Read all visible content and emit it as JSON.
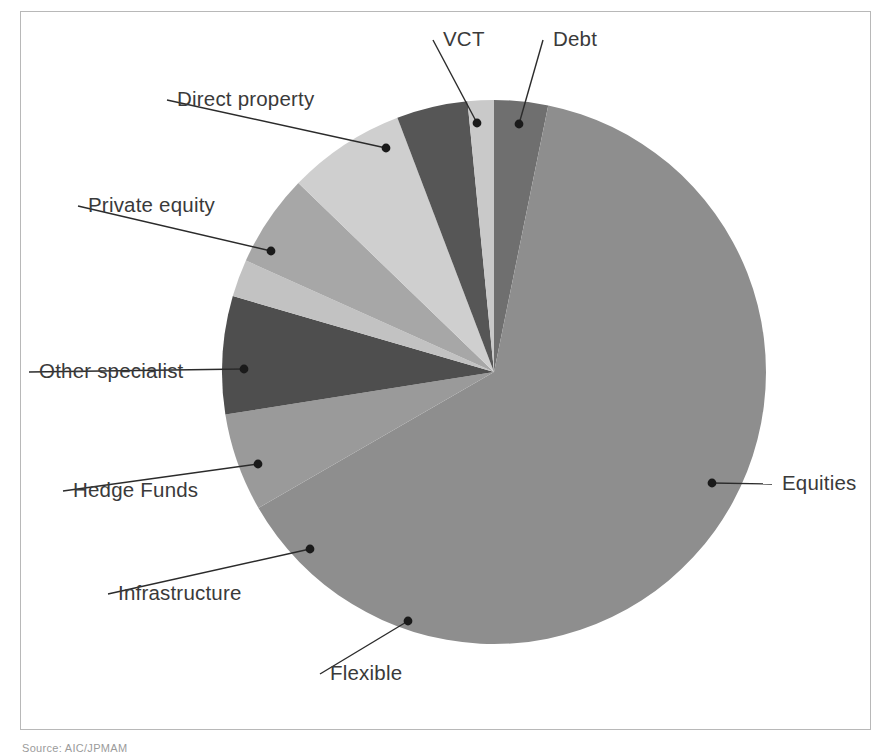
{
  "figure": {
    "caption": "Source: AIC/JPMAM",
    "frame_color": "#b8b8b8",
    "background": "#ffffff"
  },
  "chart_data": {
    "type": "pie",
    "title": "",
    "subtitle": "",
    "xlabel": "",
    "ylabel": "",
    "grid": false,
    "legend_position": "none",
    "label_style": "leader-line callouts outside pie",
    "start_angle_deg": 0,
    "direction": "clockwise",
    "center_px": [
      494,
      372
    ],
    "radius_px": 272,
    "units": "percent of total",
    "categories": [
      "Debt",
      "Equities",
      "Flexible",
      "Infrastructure",
      "Hedge Funds",
      "Other specialist",
      "Private equity",
      "Direct property",
      "VCT"
    ],
    "values": [
      3.2,
      63.5,
      5.8,
      7.0,
      2.2,
      5.5,
      7.0,
      4.2,
      1.6
    ],
    "colors": [
      "#6f6f6f",
      "#8e8e8e",
      "#9a9a9a",
      "#4e4e4e",
      "#c2c2c2",
      "#a7a7a7",
      "#cfcfcf",
      "#565656",
      "#c9c9c9"
    ],
    "slices": [
      {
        "name": "Debt",
        "label": "Debt",
        "value": 3.2,
        "color": "#6f6f6f",
        "start_angle": 0.0,
        "end_angle": 11.5,
        "label_x": 553,
        "label_y": 46,
        "label_anchor": "start",
        "dot_x": 519,
        "dot_y": 124,
        "elbow_x": 519,
        "elbow_y": 124
      },
      {
        "name": "Equities",
        "label": "Equities",
        "value": 63.5,
        "color": "#8e8e8e",
        "start_angle": 11.5,
        "end_angle": 240.0,
        "label_x": 782,
        "label_y": 490,
        "label_anchor": "start",
        "dot_x": 712,
        "dot_y": 483,
        "elbow_x": 712,
        "elbow_y": 483
      },
      {
        "name": "Flexible",
        "label": "Flexible",
        "value": 5.8,
        "color": "#9a9a9a",
        "start_angle": 240.0,
        "end_angle": 261.0,
        "label_x": 330,
        "label_y": 680,
        "label_anchor": "start",
        "dot_x": 408,
        "dot_y": 621,
        "elbow_x": 408,
        "elbow_y": 621
      },
      {
        "name": "Infrastructure",
        "label": "Infrastructure",
        "value": 7.0,
        "color": "#4e4e4e",
        "start_angle": 261.0,
        "end_angle": 286.2,
        "label_x": 118,
        "label_y": 600,
        "label_anchor": "start",
        "dot_x": 310,
        "dot_y": 549,
        "elbow_x": 310,
        "elbow_y": 549
      },
      {
        "name": "Hedge Funds",
        "label": "Hedge Funds",
        "value": 2.2,
        "color": "#c2c2c2",
        "start_angle": 286.2,
        "end_angle": 294.2,
        "label_x": 73,
        "label_y": 497,
        "label_anchor": "start",
        "dot_x": 258,
        "dot_y": 464,
        "elbow_x": 258,
        "elbow_y": 464
      },
      {
        "name": "Other specialist",
        "label": "Other specialist",
        "value": 5.5,
        "color": "#a7a7a7",
        "start_angle": 294.2,
        "end_angle": 314.0,
        "label_x": 39,
        "label_y": 378,
        "label_anchor": "start",
        "dot_x": 244,
        "dot_y": 369,
        "elbow_x": 244,
        "elbow_y": 369
      },
      {
        "name": "Private equity",
        "label": "Private equity",
        "value": 7.0,
        "color": "#cfcfcf",
        "start_angle": 314.0,
        "end_angle": 339.2,
        "label_x": 88,
        "label_y": 212,
        "label_anchor": "start",
        "dot_x": 271,
        "dot_y": 251,
        "elbow_x": 271,
        "elbow_y": 251
      },
      {
        "name": "Direct property",
        "label": "Direct property",
        "value": 4.2,
        "color": "#565656",
        "start_angle": 339.2,
        "end_angle": 354.4,
        "label_x": 177,
        "label_y": 106,
        "label_anchor": "start",
        "dot_x": 386,
        "dot_y": 148,
        "elbow_x": 386,
        "elbow_y": 148
      },
      {
        "name": "VCT",
        "label": "VCT",
        "value": 1.6,
        "color": "#c9c9c9",
        "start_angle": 354.4,
        "end_angle": 360.0,
        "label_x": 443,
        "label_y": 46,
        "label_anchor": "start",
        "dot_x": 477,
        "dot_y": 123,
        "elbow_x": 477,
        "elbow_y": 123
      }
    ]
  }
}
